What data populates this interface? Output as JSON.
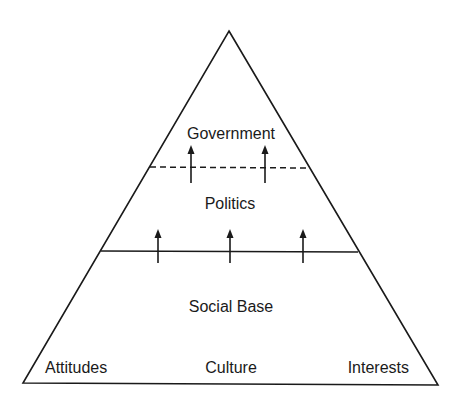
{
  "diagram": {
    "type": "pyramid",
    "levels": {
      "top": {
        "label": "Government"
      },
      "middle": {
        "label": "Politics"
      },
      "base": {
        "label": "Social Base",
        "components": [
          "Attitudes",
          "Culture",
          "Interests"
        ]
      }
    },
    "dividers": {
      "government_politics": "dashed",
      "politics_social_base": "solid"
    },
    "arrows": {
      "politics_to_government": 2,
      "social_base_to_politics": 3
    },
    "colors": {
      "line": "#1a1a1a",
      "background": "#ffffff"
    }
  }
}
